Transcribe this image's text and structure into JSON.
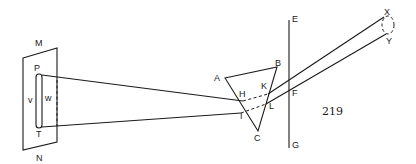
{
  "figure": {
    "page_number": "219",
    "labels": {
      "M": "M",
      "N": "N",
      "P": "P",
      "T": "T",
      "v": "v",
      "w": "w",
      "A": "A",
      "B": "B",
      "C": "C",
      "H": "H",
      "K": "K",
      "I": "I",
      "L": "L",
      "E": "E",
      "F": "F",
      "G": "G",
      "X": "X",
      "Y": "Y"
    },
    "colors": {
      "ink": "#1a1a1a",
      "background": "#ffffff"
    }
  }
}
